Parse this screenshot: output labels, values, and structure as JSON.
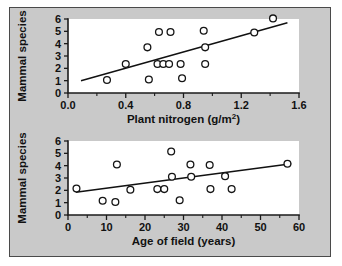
{
  "figure": {
    "background_color": "#c9c9c9",
    "plot_background_color": "#ffffff",
    "frame_color": "#4a4a4a",
    "marker_color": "#151515",
    "line_color": "#111111"
  },
  "chart_data": [
    {
      "type": "scatter",
      "id": "plant-nitrogen",
      "title": "",
      "xlabel": "Plant nitrogen (g/m",
      "xlabel_superscript": "2",
      "xlabel_suffix": ")",
      "xlabel_full": "Plant nitrogen (g/m2)",
      "ylabel": "Mammal species",
      "xlim": [
        0.0,
        1.6
      ],
      "ylim": [
        0,
        6
      ],
      "xticks": [
        0.0,
        0.4,
        0.8,
        1.2,
        1.6
      ],
      "xticklabels": [
        "0.0",
        "0.4",
        "0.8",
        "1.2",
        "1.6"
      ],
      "xticks_minor": [
        0.2,
        0.6,
        1.0,
        1.4
      ],
      "yticks": [
        0,
        1,
        2,
        3,
        4,
        5,
        6
      ],
      "yticklabels": [
        "0",
        "1",
        "2",
        "3",
        "4",
        "5",
        "6"
      ],
      "grid": false,
      "legend": "none",
      "marker": "open-circle",
      "points": [
        {
          "x": 0.27,
          "y": 1.05
        },
        {
          "x": 0.4,
          "y": 2.35
        },
        {
          "x": 0.55,
          "y": 3.7
        },
        {
          "x": 0.56,
          "y": 1.1
        },
        {
          "x": 0.62,
          "y": 2.35
        },
        {
          "x": 0.63,
          "y": 4.95
        },
        {
          "x": 0.66,
          "y": 2.35
        },
        {
          "x": 0.7,
          "y": 2.35
        },
        {
          "x": 0.71,
          "y": 4.95
        },
        {
          "x": 0.78,
          "y": 2.35
        },
        {
          "x": 0.79,
          "y": 1.2
        },
        {
          "x": 0.94,
          "y": 5.05
        },
        {
          "x": 0.95,
          "y": 3.7
        },
        {
          "x": 0.95,
          "y": 2.35
        },
        {
          "x": 1.29,
          "y": 4.9
        },
        {
          "x": 1.42,
          "y": 6.05
        }
      ],
      "trendline": {
        "x1": 0.09,
        "y1": 1.0,
        "x2": 1.52,
        "y2": 5.7
      }
    },
    {
      "type": "scatter",
      "id": "age-of-field",
      "title": "",
      "xlabel": "Age of field (years)",
      "ylabel": "Mammal species",
      "xlim": [
        0,
        60
      ],
      "ylim": [
        0,
        6
      ],
      "xticks": [
        0,
        10,
        20,
        30,
        40,
        50,
        60
      ],
      "xticklabels": [
        "0",
        "10",
        "20",
        "30",
        "40",
        "50",
        "60"
      ],
      "xticks_minor": [
        5,
        15,
        25,
        35,
        45,
        55
      ],
      "yticks": [
        0,
        1,
        2,
        3,
        4,
        5,
        6
      ],
      "yticklabels": [
        "0",
        "1",
        "2",
        "3",
        "4",
        "5",
        "6"
      ],
      "grid": false,
      "legend": "none",
      "marker": "open-circle",
      "points": [
        {
          "x": 2.2,
          "y": 2.15
        },
        {
          "x": 9.0,
          "y": 1.15
        },
        {
          "x": 12.3,
          "y": 1.05
        },
        {
          "x": 12.7,
          "y": 4.1
        },
        {
          "x": 16.2,
          "y": 2.05
        },
        {
          "x": 23.2,
          "y": 2.1
        },
        {
          "x": 25.0,
          "y": 2.1
        },
        {
          "x": 26.8,
          "y": 5.15
        },
        {
          "x": 27.0,
          "y": 3.1
        },
        {
          "x": 29.0,
          "y": 1.2
        },
        {
          "x": 31.8,
          "y": 4.1
        },
        {
          "x": 32.0,
          "y": 3.1
        },
        {
          "x": 36.8,
          "y": 4.05
        },
        {
          "x": 37.0,
          "y": 2.1
        },
        {
          "x": 40.8,
          "y": 3.15
        },
        {
          "x": 42.5,
          "y": 2.1
        },
        {
          "x": 57.0,
          "y": 4.15
        }
      ],
      "trendline": {
        "x1": 2.0,
        "y1": 1.85,
        "x2": 58.0,
        "y2": 4.15
      }
    }
  ]
}
